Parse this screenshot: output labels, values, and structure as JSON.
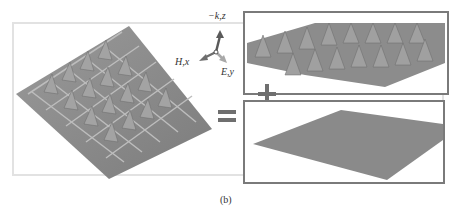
{
  "figure": {
    "caption": "(b)",
    "axes": {
      "z_label": "−k,z",
      "x_label": "H,x",
      "y_label": "E,y"
    },
    "operators": {
      "equals": "=",
      "plus": "+"
    },
    "panels": [
      {
        "id": "full-structure",
        "description": "pyramid array with grid ridges on ground plane"
      },
      {
        "id": "pyramid-array",
        "description": "pyramid array with ridges, no ground plane"
      },
      {
        "id": "ground-plane",
        "description": "flat ground plane sheet"
      }
    ],
    "colors": {
      "surface": "#8a8a8a",
      "panel_border": "#7a7a7a",
      "frame": "#e2e2e2",
      "arrow_z": "#5a5a5a",
      "arrow_x": "#6e6e6e",
      "arrow_y": "#a8a8a8"
    }
  }
}
